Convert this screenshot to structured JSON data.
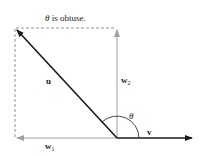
{
  "diagram": {
    "title": "θ is obtuse.",
    "title_theta": "θ",
    "title_rest": " is obtuse.",
    "vectors": {
      "u": {
        "label": "u",
        "color": "#1a1a1a"
      },
      "v": {
        "label": "v",
        "color": "#1a1a1a"
      },
      "w1": {
        "label": "w",
        "subscript": "1",
        "color": "#9a9a9a"
      },
      "w2": {
        "label": "w",
        "subscript": "2",
        "color": "#9a9a9a"
      }
    },
    "angle_label": "θ",
    "colors": {
      "main": "#1a1a1a",
      "component": "#a0a0a0",
      "dashed": "#777777"
    }
  }
}
